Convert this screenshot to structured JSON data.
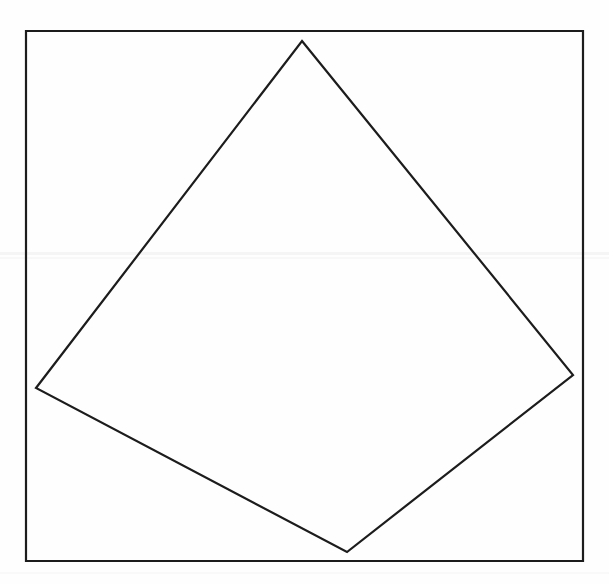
{
  "document": {
    "title": "Geometric figure: quadrilateral inscribed in a rectangle",
    "background_color": "#fefefe",
    "width": 609,
    "height": 584
  },
  "figure": {
    "label": "inscribed-quadrilateral-diagram",
    "stroke_color": "#1c1c1c",
    "stroke_width": 2.2,
    "fill": "none",
    "outer_rectangle": {
      "name": "bounding-rectangle",
      "left": 26,
      "top": 31,
      "right": 583,
      "bottom": 561,
      "width": 557,
      "height": 530,
      "points": "26,31 583,31 583,561 26,561"
    },
    "inner_quadrilateral": {
      "name": "inscribed-quadrilateral",
      "points": "302,41 573,375 347,552 36,388",
      "vertices": [
        {
          "name": "vertex-top",
          "x": 302,
          "y": 41
        },
        {
          "name": "vertex-right",
          "x": 573,
          "y": 375
        },
        {
          "name": "vertex-bottom",
          "x": 347,
          "y": 552
        },
        {
          "name": "vertex-left",
          "x": 36,
          "y": 388
        }
      ],
      "edges": [
        {
          "name": "edge-top-left",
          "from": "vertex-top",
          "to": "vertex-left"
        },
        {
          "name": "edge-top-right",
          "from": "vertex-top",
          "to": "vertex-right"
        },
        {
          "name": "edge-bottom-right",
          "from": "vertex-right",
          "to": "vertex-bottom"
        },
        {
          "name": "edge-bottom-left",
          "from": "vertex-bottom",
          "to": "vertex-left"
        }
      ]
    },
    "artifacts": [
      {
        "name": "scan-line-artifact",
        "y": 252,
        "height": 3,
        "color": "rgba(0,0,0,0.035)"
      },
      {
        "name": "scan-line-artifact",
        "y": 257,
        "height": 2,
        "color": "rgba(0,0,0,0.022)"
      },
      {
        "name": "scan-line-artifact",
        "y": 572,
        "height": 2,
        "color": "rgba(0,0,0,0.018)"
      }
    ]
  }
}
